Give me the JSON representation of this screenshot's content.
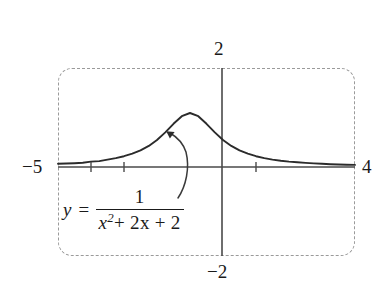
{
  "figure": {
    "caption_equation": {
      "lhs": "y =",
      "numerator": "1",
      "denominator_var": "x",
      "denominator_exp": "2",
      "denominator_rest": "+ 2x + 2",
      "plain": "y = 1/(x^2 + 2x + 2)"
    }
  },
  "axes": {
    "x_min_label": "−5",
    "x_max_label": "4",
    "y_max_label": "2",
    "y_min_label": "−2"
  },
  "chart_data": {
    "type": "line",
    "title": "",
    "subtitle": "",
    "xlabel": "",
    "ylabel": "",
    "xlim": [
      -5,
      4
    ],
    "ylim": [
      -2,
      2
    ],
    "grid": false,
    "legend": null,
    "frame_style": "dashed rounded rectangle",
    "function": "y = 1/(x^2 + 2x + 2)",
    "x_ticks": [
      -4,
      -3,
      1
    ],
    "y_ticks": [],
    "annotations": [
      {
        "type": "curved-arrow",
        "text": "",
        "points_to": "curve",
        "from_xy": [
          -1.35,
          -0.55
        ],
        "to_xy": [
          -1.65,
          0.6
        ]
      },
      {
        "type": "equation-label",
        "text": "y = 1/(x^2 + 2x + 2)",
        "at_xy": [
          -4.8,
          -0.45
        ]
      }
    ],
    "series": [
      {
        "name": "y = 1/(x^2 + 2x + 2)",
        "color": "#2b2b2b",
        "x": [
          -5,
          -4.75,
          -4.5,
          -4.25,
          -4,
          -3.75,
          -3.5,
          -3.25,
          -3,
          -2.75,
          -2.5,
          -2.25,
          -2,
          -1.75,
          -1.5,
          -1.25,
          -1,
          -0.75,
          -0.5,
          -0.25,
          0,
          0.25,
          0.5,
          0.75,
          1,
          1.25,
          1.5,
          1.75,
          2,
          2.25,
          2.5,
          2.75,
          3,
          3.25,
          3.5,
          3.75,
          4
        ],
        "y": [
          0.0588,
          0.0649,
          0.0702,
          0.078,
          0.1,
          0.1096,
          0.1379,
          0.1649,
          0.2,
          0.2462,
          0.3077,
          0.3902,
          0.5,
          0.64,
          0.8,
          0.9412,
          1.0,
          0.9412,
          0.8,
          0.64,
          0.5,
          0.3902,
          0.3077,
          0.2462,
          0.2,
          0.1649,
          0.1379,
          0.1171,
          0.1,
          0.0871,
          0.0762,
          0.0673,
          0.0588,
          0.0527,
          0.0471,
          0.0424,
          0.0385
        ]
      }
    ]
  }
}
